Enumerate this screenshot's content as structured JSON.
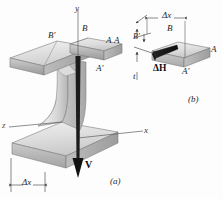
{
  "figure": {
    "captions": {
      "a": "(a)",
      "b": "(b)"
    },
    "axes": {
      "y": "y",
      "x": "x",
      "z": "z"
    },
    "part_a": {
      "points": {
        "A": "A",
        "A_prime": "A'",
        "B": "B",
        "B_prime": "B'"
      },
      "shear_force": "V",
      "delta_x": "Δx"
    },
    "part_b": {
      "points": {
        "A": "A",
        "A_prime": "A'",
        "B": "B",
        "B_prime": "B'"
      },
      "delta_x": "Δx",
      "thickness": "t",
      "delta_h": "ΔH"
    },
    "colors": {
      "background": "#fdfdfd",
      "steel_light": "#ededed",
      "steel_mid": "#d6d6d6",
      "steel_dark": "#b3b3b3",
      "steel_edge": "#8f8f8f",
      "outline": "#6e6e6e",
      "arrow": "#1c1c1c",
      "label": "#252525"
    }
  }
}
